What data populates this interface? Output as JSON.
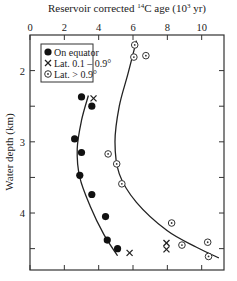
{
  "chart_data": {
    "type": "scatter",
    "title": "",
    "xlabel": "Reservoir corrected 14C age (10^3 yr)",
    "xlabel_parts": {
      "prefix": "Reservoir corrected ",
      "sup1": "14",
      "mid": "C age (10",
      "sup2": "3",
      "suffix": " yr)"
    },
    "ylabel": "Water depth (km)",
    "xlim": [
      0,
      11.3
    ],
    "ylim": [
      1.5,
      4.8
    ],
    "y_inverted": true,
    "x_axis_position": "top",
    "x_ticks": [
      0,
      2,
      4,
      6,
      8,
      10
    ],
    "y_ticks": [
      2,
      3,
      4
    ],
    "y_minor_ticks": [
      2.5,
      3.5,
      4.5
    ],
    "grid": false,
    "legend_position": "upper-left",
    "series": [
      {
        "name": "On equator",
        "marker": "filled-circle",
        "points": [
          {
            "x": 3.0,
            "y": 2.37
          },
          {
            "x": 3.6,
            "y": 2.5
          },
          {
            "x": 2.6,
            "y": 2.96
          },
          {
            "x": 3.0,
            "y": 3.15
          },
          {
            "x": 2.9,
            "y": 3.47
          },
          {
            "x": 3.6,
            "y": 3.74
          },
          {
            "x": 4.4,
            "y": 4.05
          },
          {
            "x": 4.5,
            "y": 4.38
          },
          {
            "x": 5.1,
            "y": 4.5
          }
        ]
      },
      {
        "name": "Lat. 0.1 – 0.9°",
        "marker": "cross",
        "points": [
          {
            "x": 3.7,
            "y": 2.39
          },
          {
            "x": 5.8,
            "y": 4.56
          },
          {
            "x": 7.95,
            "y": 4.42
          },
          {
            "x": 7.95,
            "y": 4.51
          }
        ]
      },
      {
        "name": "Lat. > 0.9°",
        "marker": "dotted-circle",
        "points": [
          {
            "x": 6.1,
            "y": 1.64
          },
          {
            "x": 6.05,
            "y": 1.81
          },
          {
            "x": 6.75,
            "y": 1.79
          },
          {
            "x": 4.55,
            "y": 3.17
          },
          {
            "x": 5.05,
            "y": 3.31
          },
          {
            "x": 5.35,
            "y": 3.59
          },
          {
            "x": 8.25,
            "y": 4.14
          },
          {
            "x": 8.85,
            "y": 4.45
          },
          {
            "x": 10.35,
            "y": 4.41
          },
          {
            "x": 10.4,
            "y": 4.61
          }
        ]
      }
    ],
    "fit_curves": [
      {
        "name": "equator-fit",
        "points": [
          [
            3.4,
            2.35
          ],
          [
            3.0,
            2.7
          ],
          [
            2.75,
            3.1
          ],
          [
            2.9,
            3.5
          ],
          [
            3.5,
            3.9
          ],
          [
            4.3,
            4.3
          ],
          [
            5.1,
            4.6
          ]
        ]
      },
      {
        "name": "high-lat-fit",
        "points": [
          [
            6.2,
            1.58
          ],
          [
            5.7,
            2.05
          ],
          [
            5.2,
            2.5
          ],
          [
            4.95,
            3.0
          ],
          [
            5.2,
            3.45
          ],
          [
            6.2,
            3.85
          ],
          [
            8.0,
            4.25
          ],
          [
            9.7,
            4.48
          ],
          [
            11.0,
            4.63
          ]
        ]
      }
    ]
  }
}
